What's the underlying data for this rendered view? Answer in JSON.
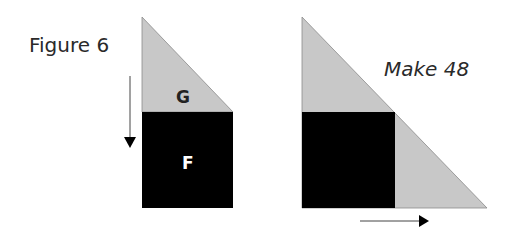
{
  "figure": {
    "title": "Figure 6",
    "caption": "Make 48",
    "labels": {
      "triangle": "G",
      "square": "F"
    },
    "colors": {
      "gray": "#c8c8c8",
      "black": "#000000",
      "text": "#2a2a2a"
    },
    "arrows": {
      "left": "down-arrow",
      "right": "right-arrow"
    }
  }
}
